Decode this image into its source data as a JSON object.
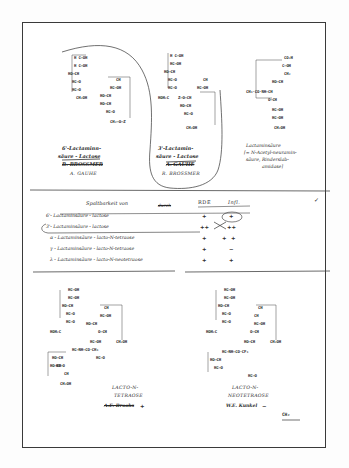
{
  "document": {
    "kind": "handwritten-lab-notebook-page",
    "has_border_frame": true
  },
  "top_section": {
    "structures": [
      {
        "id": "struct-6-prime",
        "lines": [
          "H C–OH",
          "H C–OH",
          "HO–CH",
          "HC–O",
          "HC–O",
          "CH₂OH"
        ],
        "branch_lines": [
          "CH",
          "HC–OH",
          "HO–CH",
          "HO–CH",
          "HC–O",
          "CH₂–O–Z"
        ],
        "caption_line1": "6'-Lactaminn-",
        "caption_line2": "säure - Lactose",
        "caption_struck": "R. BROSSMER",
        "caption_author": "A. GAUHE"
      },
      {
        "id": "struct-3-prime",
        "lines": [
          "H C–OH",
          "HC–OH",
          "HO–CH",
          "HC–O",
          "HC–O",
          "HOH₂C"
        ],
        "branch_lines": [
          "CH",
          "HC–OH",
          "Z–O–CH",
          "HO–CH",
          "HC–O",
          "CH₂OH"
        ],
        "caption_line1": "3'-Lactamin-",
        "caption_line2": "säure - Lactose",
        "caption_struck": "A. GAUHE",
        "caption_author": "R. BROSSMER"
      },
      {
        "id": "struct-lactaminic-acid",
        "lines": [
          "CO₂H",
          "C–OH",
          "CH₂",
          "HO–CH",
          "CH₃·CO·NH–CH",
          "O–CH",
          "HC–OH",
          "HC–OH",
          "CH₂OH"
        ],
        "caption_line1": "Lactaminsäure",
        "caption_line2": "[= N-Acetyl-neuramin-",
        "caption_line3": "säure, Rinderslab-",
        "caption_line4": "amidase]"
      }
    ]
  },
  "table": {
    "title": "Spaltbarkeit von",
    "by_label_struck": "durch",
    "columns": [
      "RDE",
      "Infl."
    ],
    "rows": [
      {
        "substrate": "6'- Lactaminsäure - lactose",
        "rde": "+",
        "infl": "+",
        "infl_circled": true,
        "infl_struck": false
      },
      {
        "substrate": "3'- Lactaminsäure - lactose",
        "rde": "++",
        "infl": "++",
        "infl_circled": false,
        "infl_struck": false
      },
      {
        "substrate": "α - Lactaminsäure - lacto-N-tetraose",
        "rde": "+",
        "infl": "+",
        "infl_circled": false,
        "infl_struck": true
      },
      {
        "substrate": "γ - Lactaminsäure - lacto-N-tetraose",
        "rde": "+",
        "infl": "−",
        "infl_circled": false,
        "infl_struck": false
      },
      {
        "substrate": "λ - Lactaminsäure - lacto-N-neotetraose",
        "rde": "+",
        "infl": "+",
        "infl_circled": false,
        "infl_struck": false
      }
    ],
    "checkmark": "✓",
    "row1_circled": false,
    "row2_circled": true
  },
  "bottom_section": {
    "structures": [
      {
        "id": "struct-lacto-n-tetraose",
        "lines": [
          "HC–OH",
          "HC–OH",
          "HO–CH",
          "HC–O",
          "HC–O",
          "HOH₂C",
          "O–CH",
          "CH",
          "HC–NH–CO·CH₃",
          "HO–CH",
          "HC–O",
          "CH",
          "HC–OH",
          "HC–OH",
          "HO–CH",
          "HO–CH",
          "HC–O",
          "CH₂OH",
          "CH₂OH"
        ],
        "caption_line1": "LACTO-N-",
        "caption_line2": "TETRAOSE",
        "caption_struck": "A.E. Brooks",
        "caption_mark": "+"
      },
      {
        "id": "struct-lacto-n-neotetraose",
        "lines": [
          "HC–OH",
          "HC–OH",
          "HO–CH",
          "HC–O",
          "HC–O",
          "HOH₂C",
          "O–CH",
          "CH",
          "HC–NH–CO·CF₃",
          "HO–CH",
          "HC–O",
          "CH",
          "HC–OH",
          "HO–CH",
          "HC–O",
          "CH₂OH"
        ],
        "caption_line1": "LACTO-N-",
        "caption_line2": "NEOTETRAOSE",
        "caption_author": "W.E. Kunkel",
        "caption_mark": "−"
      }
    ],
    "trailing_fragment": "CH₂"
  }
}
